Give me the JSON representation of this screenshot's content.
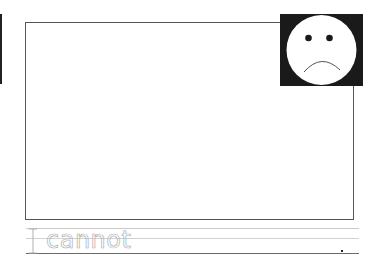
{
  "worksheet": {
    "tracing_text": {
      "pronoun": "I",
      "word": "cannot"
    },
    "face_icon": "sad-face-icon",
    "colors": {
      "face_background": "#1a1a1a",
      "face_fill": "#ffffff",
      "frame_border": "#555555",
      "tracing_stroke": "#b0b0b0",
      "baseline": "#6a6a6a"
    }
  }
}
